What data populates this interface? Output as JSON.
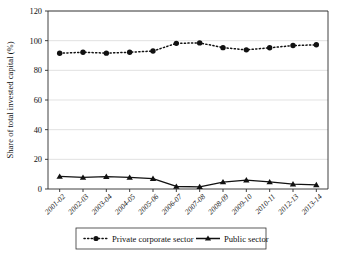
{
  "chart_data": {
    "type": "line",
    "title": "",
    "xlabel": "",
    "ylabel": "Share of total invested capital (%)",
    "categories": [
      "2001-02",
      "2002-03",
      "2003-04",
      "2004-05",
      "2005-06",
      "2006-07",
      "2007-08",
      "2008-09",
      "2009-10",
      "2010-11",
      "2012-13",
      "2013-14"
    ],
    "series": [
      {
        "name": "Private corporate sector",
        "marker": "circle",
        "line_style": "dotted",
        "values": [
          91.5,
          92.2,
          91.6,
          92.2,
          93.0,
          98.2,
          98.5,
          95.3,
          93.8,
          95.2,
          96.7,
          97.2
        ]
      },
      {
        "name": "Public sector",
        "marker": "triangle",
        "line_style": "solid",
        "values": [
          8.5,
          7.8,
          8.4,
          7.8,
          7.0,
          1.7,
          1.5,
          4.7,
          6.0,
          4.8,
          3.3,
          2.8
        ]
      }
    ],
    "ylim": [
      0,
      120
    ],
    "yticks": [
      0,
      20,
      40,
      60,
      80,
      100,
      120
    ],
    "grid": true,
    "legend_position": "bottom",
    "colors": {
      "series": "#111111",
      "gridline": "#d6d6d6",
      "axis": "#2b2b2b",
      "background": "#ffffff"
    }
  }
}
